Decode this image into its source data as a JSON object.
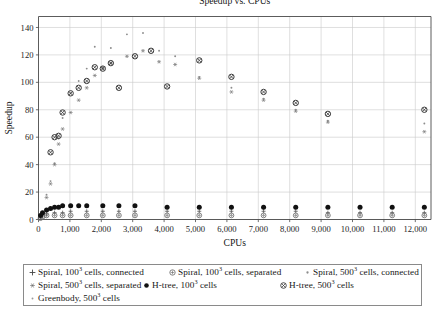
{
  "chart_data": {
    "type": "scatter",
    "title": "Speedup vs. CPUs",
    "xlabel": "CPUs",
    "ylabel": "Speedup",
    "xlim": [
      0,
      12500
    ],
    "ylim": [
      0,
      148
    ],
    "xticks": [
      0,
      1000,
      2000,
      3000,
      4000,
      5000,
      6000,
      7000,
      8000,
      9000,
      10000,
      11000,
      12000
    ],
    "xtick_labels": [
      "0",
      "1,000",
      "2,000",
      "3,000",
      "4,000",
      "5,000",
      "6,000",
      "7,000",
      "8,000",
      "9,000",
      "10,000",
      "11,000",
      "12,000"
    ],
    "yticks": [
      0,
      20,
      40,
      60,
      80,
      100,
      120,
      140
    ],
    "ytick_labels": [
      "0",
      "20",
      "40",
      "60",
      "80",
      "100",
      "120",
      "140"
    ],
    "grid": true,
    "legend_position": "below-axes",
    "series": [
      {
        "name": "Spiral, 100<sup>3</sup> cells, connected",
        "marker": "plus",
        "color": "#555555",
        "points": [
          [
            64,
            2
          ],
          [
            128,
            3
          ],
          [
            256,
            4
          ],
          [
            512,
            5
          ],
          [
            768,
            5
          ],
          [
            1024,
            6
          ],
          [
            1536,
            6
          ],
          [
            2048,
            6
          ],
          [
            2560,
            6
          ],
          [
            3072,
            6
          ],
          [
            4096,
            6
          ],
          [
            5120,
            6
          ],
          [
            6144,
            6
          ],
          [
            7168,
            6
          ],
          [
            8192,
            6
          ],
          [
            9216,
            5
          ],
          [
            10240,
            5
          ],
          [
            11264,
            5
          ],
          [
            12288,
            5
          ]
        ]
      },
      {
        "name": "Spiral, 100<sup>3</sup> cells, separated",
        "marker": "circle-plus",
        "color": "#6a6a6a",
        "points": [
          [
            64,
            1
          ],
          [
            128,
            2
          ],
          [
            256,
            3
          ],
          [
            512,
            3
          ],
          [
            768,
            3
          ],
          [
            1024,
            3
          ],
          [
            1536,
            3
          ],
          [
            2048,
            3
          ],
          [
            2560,
            3
          ],
          [
            3072,
            3
          ],
          [
            4096,
            3
          ],
          [
            5120,
            3
          ],
          [
            6144,
            3
          ],
          [
            7168,
            3
          ],
          [
            8192,
            3
          ],
          [
            9216,
            3
          ],
          [
            10240,
            3
          ],
          [
            11264,
            3
          ],
          [
            12288,
            3
          ]
        ]
      },
      {
        "name": "Spiral, 500<sup>3</sup> cells, connected",
        "marker": "dot",
        "color": "#8c8c8c",
        "points": [
          [
            256,
            18
          ],
          [
            384,
            28
          ],
          [
            512,
            41
          ],
          [
            640,
            59
          ],
          [
            768,
            74
          ],
          [
            1024,
            92
          ],
          [
            1280,
            101
          ],
          [
            1536,
            110
          ],
          [
            1792,
            126
          ],
          [
            2048,
            111
          ],
          [
            2304,
            125
          ],
          [
            2816,
            135
          ],
          [
            3328,
            136
          ],
          [
            3840,
            123
          ],
          [
            4352,
            119
          ],
          [
            5120,
            104
          ],
          [
            6144,
            96
          ],
          [
            7168,
            88
          ],
          [
            8192,
            80
          ],
          [
            9216,
            72
          ],
          [
            12288,
            70
          ]
        ]
      },
      {
        "name": "Spiral, 500<sup>3</sup> cells, separated",
        "marker": "star",
        "color": "#787878",
        "points": [
          [
            256,
            16
          ],
          [
            384,
            26
          ],
          [
            512,
            40
          ],
          [
            640,
            55
          ],
          [
            768,
            66
          ],
          [
            1024,
            78
          ],
          [
            1280,
            87
          ],
          [
            1536,
            96
          ],
          [
            1792,
            105
          ],
          [
            2048,
            110
          ],
          [
            2304,
            114
          ],
          [
            2816,
            119
          ],
          [
            3328,
            123
          ],
          [
            3840,
            115
          ],
          [
            4352,
            113
          ],
          [
            5120,
            103
          ],
          [
            6144,
            93
          ],
          [
            7168,
            87
          ],
          [
            8192,
            79
          ],
          [
            9216,
            71
          ],
          [
            12288,
            64
          ]
        ]
      },
      {
        "name": "H-tree, 100<sup>3</sup> cells",
        "marker": "filled-dot",
        "color": "#111111",
        "points": [
          [
            64,
            3
          ],
          [
            128,
            5
          ],
          [
            256,
            7
          ],
          [
            384,
            8
          ],
          [
            512,
            9
          ],
          [
            640,
            9
          ],
          [
            768,
            10
          ],
          [
            1024,
            10
          ],
          [
            1280,
            10
          ],
          [
            1536,
            10
          ],
          [
            2048,
            10
          ],
          [
            2560,
            10
          ],
          [
            3072,
            10
          ],
          [
            4096,
            9
          ],
          [
            5120,
            9
          ],
          [
            6144,
            9
          ],
          [
            7168,
            9
          ],
          [
            8192,
            9
          ],
          [
            9216,
            9
          ],
          [
            10240,
            9
          ],
          [
            11264,
            9
          ],
          [
            12288,
            9
          ]
        ]
      },
      {
        "name": "H-tree, 500<sup>3</sup> cells",
        "marker": "circle-cross",
        "color": "#3a3a3a",
        "points": [
          [
            384,
            49
          ],
          [
            512,
            60
          ],
          [
            640,
            61
          ],
          [
            768,
            78
          ],
          [
            1024,
            92
          ],
          [
            1280,
            96
          ],
          [
            1536,
            101
          ],
          [
            1792,
            111
          ],
          [
            2048,
            110
          ],
          [
            2304,
            114
          ],
          [
            2560,
            96
          ],
          [
            3072,
            119
          ],
          [
            3584,
            123
          ],
          [
            4096,
            97
          ],
          [
            5120,
            116
          ],
          [
            6144,
            104
          ],
          [
            7168,
            93
          ],
          [
            8192,
            85
          ],
          [
            9216,
            77
          ],
          [
            12288,
            80
          ]
        ]
      },
      {
        "name": "Greenbody, 500<sup>3</sup> cells",
        "marker": "tiny-dot",
        "color": "#9a9a9a",
        "points": [
          [
            256,
            2
          ],
          [
            512,
            3
          ],
          [
            768,
            3
          ],
          [
            1024,
            3
          ],
          [
            1536,
            3
          ],
          [
            2048,
            3
          ],
          [
            2560,
            3
          ],
          [
            3072,
            3
          ],
          [
            4096,
            3
          ],
          [
            5120,
            3
          ],
          [
            6144,
            3
          ],
          [
            7168,
            3
          ],
          [
            8192,
            3
          ],
          [
            9216,
            3
          ],
          [
            10240,
            3
          ],
          [
            11264,
            3
          ],
          [
            12288,
            3
          ]
        ]
      }
    ]
  },
  "legend": {
    "entries": [
      {
        "label": "Spiral, 100",
        "exp": "3",
        "tail": " cells, connected",
        "marker": "plus"
      },
      {
        "label": "Spiral, 100",
        "exp": "3",
        "tail": " cells, separated",
        "marker": "circle-plus"
      },
      {
        "label": "Spiral, 500",
        "exp": "3",
        "tail": " cells, connected",
        "marker": "dot"
      },
      {
        "label": "Spiral, 500",
        "exp": "3",
        "tail": " cells, separated",
        "marker": "star"
      },
      {
        "label": "H-tree, 100",
        "exp": "3",
        "tail": " cells",
        "marker": "filled-dot"
      },
      {
        "label": "H-tree, 500",
        "exp": "3",
        "tail": " cells",
        "marker": "circle-cross"
      },
      {
        "label": "Greenbody, 500",
        "exp": "3",
        "tail": " cells",
        "marker": "tiny-dot"
      }
    ]
  },
  "colors": {
    "axis": "#4a4a4a",
    "grid": "#c9c9c9",
    "text": "#181818",
    "background": "#ffffff"
  }
}
